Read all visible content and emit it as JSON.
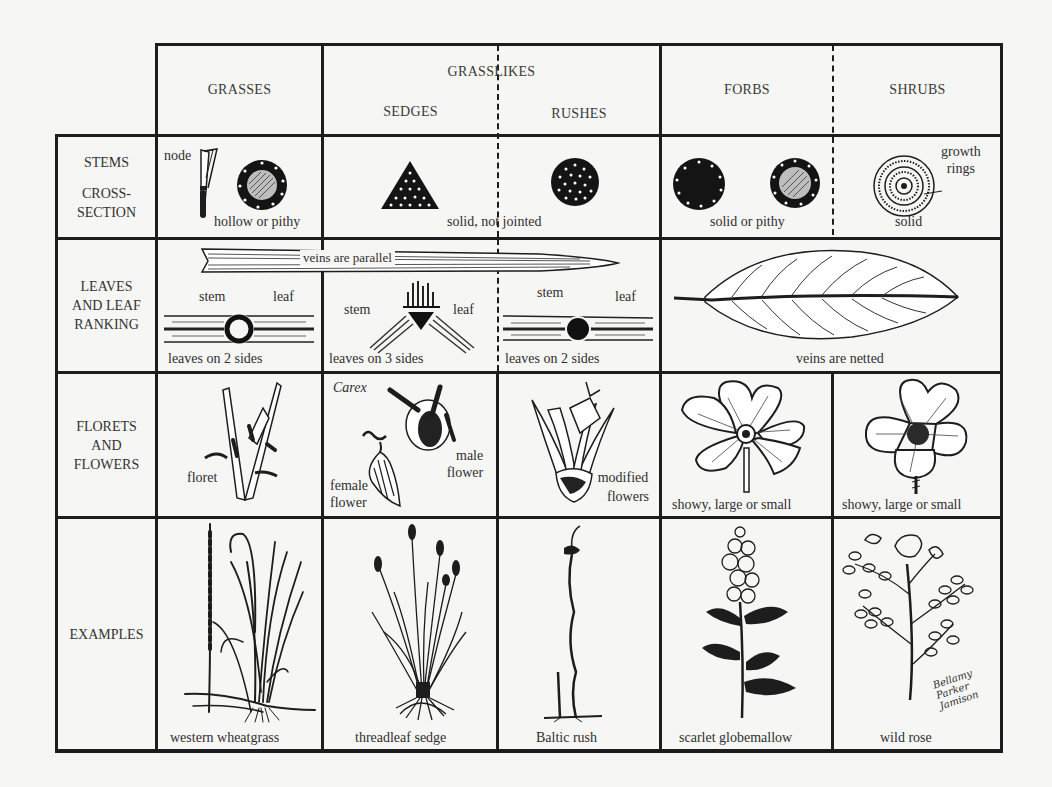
{
  "header": {
    "grasslikes": "GRASSLIKES",
    "columns": [
      {
        "key": "grasses",
        "label": "GRASSES"
      },
      {
        "key": "sedges",
        "label": "SEDGES"
      },
      {
        "key": "rushes",
        "label": "RUSHES"
      },
      {
        "key": "forbs",
        "label": "FORBS"
      },
      {
        "key": "shrubs",
        "label": "SHRUBS"
      }
    ]
  },
  "rows": {
    "stems": {
      "label_line1": "STEMS",
      "label_line2": "CROSS-",
      "label_line3": "SECTION",
      "grasses": {
        "node_label": "node",
        "caption": "hollow or pithy"
      },
      "grasslikes": {
        "caption": "solid, not jointed"
      },
      "forbs": {
        "caption": "solid or pithy"
      },
      "shrubs": {
        "annotation_line1": "growth",
        "annotation_line2": "rings",
        "caption": "solid"
      }
    },
    "leaves": {
      "label_line1": "LEAVES",
      "label_line2": "AND LEAF",
      "label_line3": "RANKING",
      "parallel_label": "veins are parallel",
      "grasses": {
        "stem_label": "stem",
        "leaf_label": "leaf",
        "caption": "leaves on 2 sides"
      },
      "sedges": {
        "stem_label": "stem",
        "leaf_label": "leaf",
        "caption": "leaves on 3 sides"
      },
      "rushes": {
        "stem_label": "stem",
        "leaf_label": "leaf",
        "caption": "leaves on 2 sides"
      },
      "forbs_shrubs": {
        "caption": "veins are netted"
      }
    },
    "flowers": {
      "label_line1": "FLORETS",
      "label_line2": "AND",
      "label_line3": "FLOWERS",
      "grasses": {
        "caption": "floret"
      },
      "sedges": {
        "genus": "Carex",
        "female_line1": "female",
        "female_line2": "flower",
        "male_line1": "male",
        "male_line2": "flower"
      },
      "rushes": {
        "caption_line1": "modified",
        "caption_line2": "flowers"
      },
      "forbs": {
        "caption": "showy, large or small"
      },
      "shrubs": {
        "caption": "showy, large or small"
      }
    },
    "examples": {
      "label": "EXAMPLES",
      "grasses": {
        "caption": "western wheatgrass"
      },
      "sedges": {
        "caption": "threadleaf sedge"
      },
      "rushes": {
        "caption": "Baltic rush"
      },
      "forbs": {
        "caption": "scarlet globemallow"
      },
      "shrubs": {
        "caption": "wild rose"
      },
      "signature": "Bellamy Parker Jamison"
    }
  },
  "colors": {
    "ink": "#1d1d1d",
    "paper": "#f6f6f4"
  }
}
